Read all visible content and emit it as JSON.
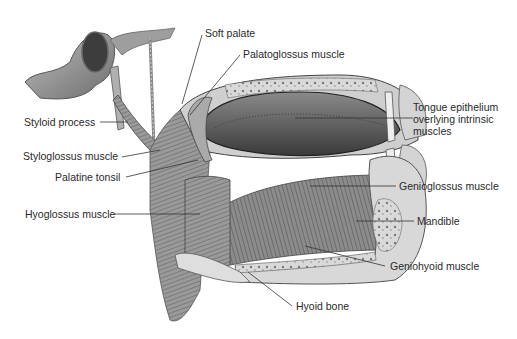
{
  "figure": {
    "type": "anatomical-illustration",
    "style": "grayscale"
  },
  "labels": [
    {
      "id": "soft-palate",
      "text": "Soft palate"
    },
    {
      "id": "palatoglossus",
      "text": "Palatoglossus muscle"
    },
    {
      "id": "styloid-process",
      "text": "Styloid process"
    },
    {
      "id": "tongue-epithelium",
      "text": "Tongue epithelium overlying intrinsic muscles"
    },
    {
      "id": "styloglossus",
      "text": "Styloglossus muscle"
    },
    {
      "id": "palatine-tonsil",
      "text": "Palatine tonsil"
    },
    {
      "id": "genioglossus",
      "text": "Genioglossus muscle"
    },
    {
      "id": "hyoglossus",
      "text": "Hyoglossus muscle"
    },
    {
      "id": "mandible",
      "text": "Mandible"
    },
    {
      "id": "geniohyoid",
      "text": "Geniohyoid muscle"
    },
    {
      "id": "hyoid-bone",
      "text": "Hyoid bone"
    }
  ]
}
